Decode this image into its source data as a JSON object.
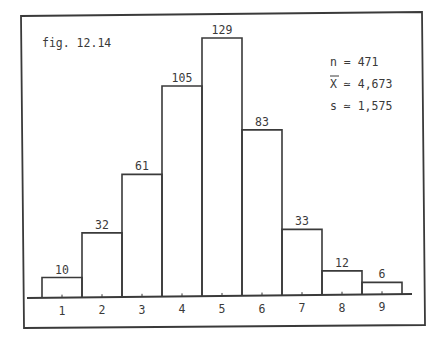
{
  "figure": {
    "caption": "fig. 12.14",
    "stats": {
      "n_label": "n = 471",
      "mean_symbol": "X",
      "mean_rest": " ≃ 4,673",
      "sd_label": "s ≃ 1,575"
    }
  },
  "chart_data": {
    "type": "bar",
    "subtype": "histogram",
    "title": "fig. 12.14",
    "categories": [
      "1",
      "2",
      "3",
      "4",
      "5",
      "6",
      "7",
      "8",
      "9"
    ],
    "values": [
      10,
      32,
      61,
      105,
      129,
      83,
      33,
      12,
      6
    ],
    "data_labels": [
      "10",
      "32",
      "61",
      "105",
      "129",
      "83",
      "33",
      "12",
      "6"
    ],
    "xlabel": "",
    "ylabel": "",
    "ylim": [
      0,
      129
    ],
    "grid": false,
    "legend": null,
    "annotations": [
      "n = 471",
      "X̄ ≃ 4,673",
      "s ≃ 1,575"
    ],
    "summary_stats": {
      "n": 471,
      "mean": "4,673",
      "sd": "1,575"
    }
  },
  "colors": {
    "ink": "#3a3a3a",
    "background": "#ffffff"
  }
}
